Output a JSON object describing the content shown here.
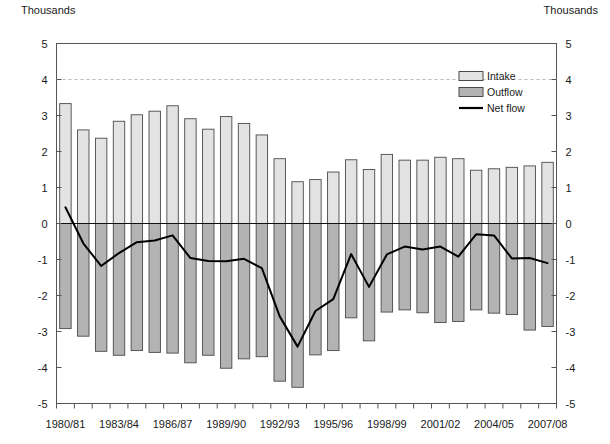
{
  "labels": {
    "unit_left": "Thousands",
    "unit_right": "Thousands"
  },
  "legend": {
    "items": [
      {
        "label": "Intake",
        "type": "swatch",
        "color": "#e3e3e3"
      },
      {
        "label": "Outflow",
        "type": "swatch",
        "color": "#b3b3b3"
      },
      {
        "label": "Net flow",
        "type": "line",
        "color": "#000000"
      }
    ]
  },
  "chart_data": {
    "type": "bar",
    "title": "",
    "xlabel": "",
    "ylabel": "Thousands",
    "ylim": [
      -5,
      5
    ],
    "yticks": [
      -5,
      -4,
      -3,
      -2,
      -1,
      0,
      1,
      2,
      3,
      4,
      5
    ],
    "ytick_labels": [
      "-5",
      "-4",
      "-3",
      "-2",
      "-1",
      "0",
      "1",
      "2",
      "3",
      "4",
      "5"
    ],
    "grid": false,
    "gridline_at": 4,
    "legend_position": "upper-right-inside",
    "dual_axis": true,
    "categories": [
      "1980/81",
      "1981/82",
      "1982/83",
      "1983/84",
      "1984/85",
      "1985/86",
      "1986/87",
      "1987/88",
      "1988/89",
      "1989/90",
      "1990/91",
      "1991/92",
      "1992/93",
      "1993/94",
      "1994/95",
      "1995/96",
      "1996/97",
      "1997/98",
      "1998/99",
      "1999/00",
      "2000/01",
      "2001/02",
      "2002/03",
      "2003/04",
      "2004/05",
      "2005/06",
      "2006/07",
      "2007/08"
    ],
    "xtick_labels": [
      "1980/81",
      "1983/84",
      "1986/87",
      "1989/90",
      "1992/93",
      "1995/96",
      "1998/99",
      "2001/02",
      "2004/05",
      "2007/08"
    ],
    "xtick_indices": [
      0,
      3,
      6,
      9,
      12,
      15,
      18,
      21,
      24,
      27
    ],
    "series": [
      {
        "name": "Intake",
        "color": "#e3e3e3",
        "values": [
          3.33,
          2.6,
          2.37,
          2.84,
          3.02,
          3.12,
          3.27,
          2.91,
          2.62,
          2.97,
          2.78,
          2.46,
          1.8,
          1.16,
          1.22,
          1.43,
          1.77,
          1.5,
          1.92,
          1.76,
          1.76,
          1.84,
          1.8,
          1.48,
          1.52,
          1.56,
          1.6,
          1.7
        ]
      },
      {
        "name": "Outflow",
        "color": "#b3b3b3",
        "values": [
          -2.92,
          -3.13,
          -3.55,
          -3.66,
          -3.53,
          -3.58,
          -3.6,
          -3.87,
          -3.66,
          -4.02,
          -3.76,
          -3.7,
          -4.38,
          -4.55,
          -3.65,
          -3.53,
          -2.62,
          -3.26,
          -2.46,
          -2.4,
          -2.48,
          -2.75,
          -2.72,
          -2.4,
          -2.49,
          -2.53,
          -2.96,
          -2.86
        ]
      },
      {
        "name": "Net flow",
        "color": "#000000",
        "values": [
          0.45,
          -0.55,
          -1.18,
          -0.82,
          -0.52,
          -0.47,
          -0.33,
          -0.96,
          -1.04,
          -1.05,
          -0.98,
          -1.24,
          -2.58,
          -3.42,
          -2.43,
          -2.1,
          -0.85,
          -1.76,
          -0.86,
          -0.64,
          -0.72,
          -0.64,
          -0.92,
          -0.3,
          -0.33,
          -0.97,
          -0.96,
          -1.1
        ]
      }
    ]
  }
}
